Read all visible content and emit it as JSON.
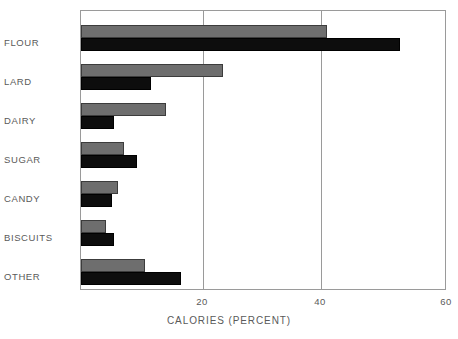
{
  "chart_data": {
    "type": "bar",
    "orientation": "horizontal",
    "title": "",
    "subtitle": "",
    "xlabel": "CALORIES (PERCENT)",
    "ylabel": "",
    "xlim": [
      0,
      60
    ],
    "xticks": [
      20,
      40,
      60
    ],
    "xtick_labels": [
      "20",
      "40",
      "60"
    ],
    "grid": "vertical-at-xticks",
    "legend": "none",
    "categories": [
      "FLOUR",
      "LARD",
      "DAIRY",
      "SUGAR",
      "CANDY",
      "BISCUITS",
      "OTHER"
    ],
    "series": [
      {
        "name": "gray",
        "color": "#6e6e6e",
        "values": [
          40.5,
          23.3,
          14.0,
          7.0,
          6.1,
          4.1,
          10.6
        ]
      },
      {
        "name": "black",
        "color": "#0d0d0d",
        "values": [
          52.5,
          11.5,
          5.4,
          9.2,
          5.1,
          5.4,
          16.5
        ]
      }
    ]
  },
  "axis": {
    "x_title": "CALORIES (PERCENT)",
    "tick_20": "20",
    "tick_40": "40",
    "tick_60": "60"
  },
  "labels": {
    "flour": "FLOUR",
    "lard": "LARD",
    "dairy": "DAIRY",
    "sugar": "SUGAR",
    "candy": "CANDY",
    "biscuits": "BISCUITS",
    "other": "OTHER"
  }
}
